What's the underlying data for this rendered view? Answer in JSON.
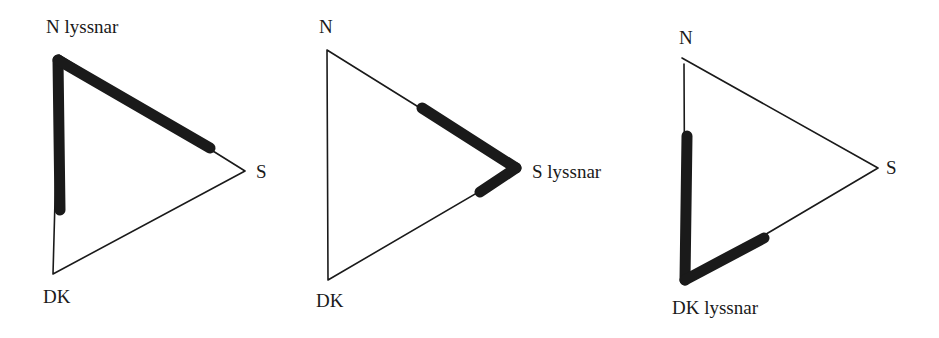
{
  "diagrams": [
    {
      "id": "north-listens",
      "labels": {
        "n": "N lyssnar",
        "s": "S",
        "dk": "DK"
      },
      "listener": "N",
      "vertices": {
        "n": [
          59,
          55
        ],
        "s": [
          245,
          171
        ],
        "dk": [
          53,
          274
        ]
      },
      "thick_segments": [
        {
          "from": [
            60,
            210
          ],
          "to": [
            59,
            58
          ]
        },
        {
          "from": [
            59,
            58
          ],
          "to": [
            210,
            148
          ]
        }
      ]
    },
    {
      "id": "south-listens",
      "labels": {
        "n": "N",
        "s": "S lyssnar",
        "dk": "DK"
      },
      "listener": "S",
      "vertices": {
        "n": [
          327,
          50
        ],
        "s": [
          518,
          169
        ],
        "dk": [
          328,
          280
        ]
      },
      "thick_segments": [
        {
          "from": [
            422,
            108
          ],
          "to": [
            516,
            168
          ]
        },
        {
          "from": [
            516,
            168
          ],
          "to": [
            480,
            192
          ]
        }
      ]
    },
    {
      "id": "dk-listens",
      "labels": {
        "n": "N",
        "s": "S",
        "dk": "DK lyssnar"
      },
      "listener": "DK",
      "vertices": {
        "n": [
          683,
          58
        ],
        "s": [
          878,
          168
        ],
        "dk": [
          685,
          282
        ]
      },
      "thick_segments": [
        {
          "from": [
            687,
            136
          ],
          "to": [
            685,
            280
          ]
        },
        {
          "from": [
            685,
            280
          ],
          "to": [
            764,
            238
          ]
        }
      ]
    }
  ]
}
